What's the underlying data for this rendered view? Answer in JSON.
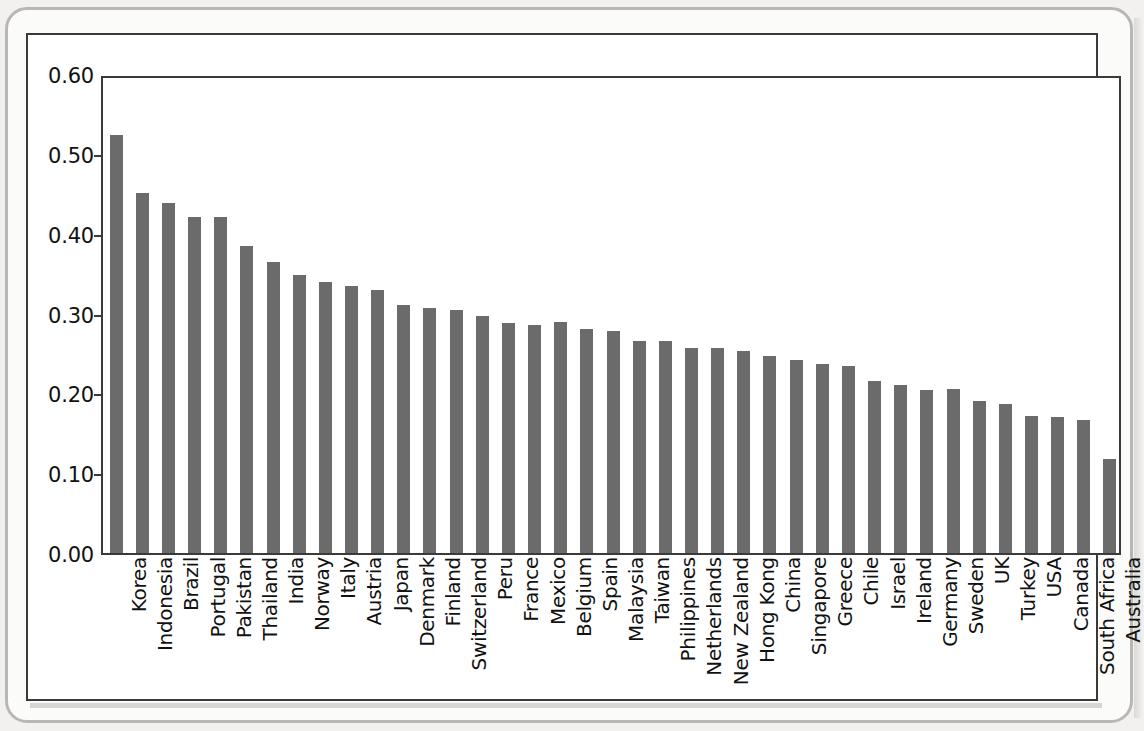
{
  "chart_data": {
    "type": "bar",
    "title": "",
    "subtitle": "",
    "xlabel": "",
    "ylabel": "",
    "ylim": [
      0.0,
      0.6
    ],
    "ytick_labels": [
      "0.60",
      "0.50",
      "0.40",
      "0.30",
      "0.20",
      "0.10",
      "0.00"
    ],
    "ytick_values": [
      0.6,
      0.5,
      0.4,
      0.3,
      0.2,
      0.1,
      0.0
    ],
    "grid": false,
    "legend": null,
    "bar_color": "#6b6b6b",
    "axis_color": "#3a3a3a",
    "categories": [
      "Korea",
      "Indonesia",
      "Brazil",
      "Portugal",
      "Pakistan",
      "Thailand",
      "India",
      "Norway",
      "Italy",
      "Austria",
      "Japan",
      "Denmark",
      "Finland",
      "Switzerland",
      "Peru",
      "France",
      "Mexico",
      "Belgium",
      "Spain",
      "Malaysia",
      "Taiwan",
      "Philippines",
      "Netherlands",
      "New Zealand",
      "Hong Kong",
      "China",
      "Singapore",
      "Greece",
      "Chile",
      "Israel",
      "Ireland",
      "Germany",
      "Sweden",
      "UK",
      "Turkey",
      "USA",
      "Canada",
      "South Africa",
      "Australia"
    ],
    "values": [
      0.523,
      0.451,
      0.438,
      0.421,
      0.421,
      0.385,
      0.364,
      0.348,
      0.339,
      0.335,
      0.33,
      0.311,
      0.307,
      0.304,
      0.297,
      0.288,
      0.286,
      0.289,
      0.281,
      0.278,
      0.266,
      0.265,
      0.257,
      0.257,
      0.253,
      0.247,
      0.242,
      0.237,
      0.234,
      0.215,
      0.21,
      0.204,
      0.205,
      0.19,
      0.187,
      0.172,
      0.171,
      0.166,
      0.118
    ]
  },
  "figure": {
    "frame_present": true,
    "background": "#ffffff"
  }
}
